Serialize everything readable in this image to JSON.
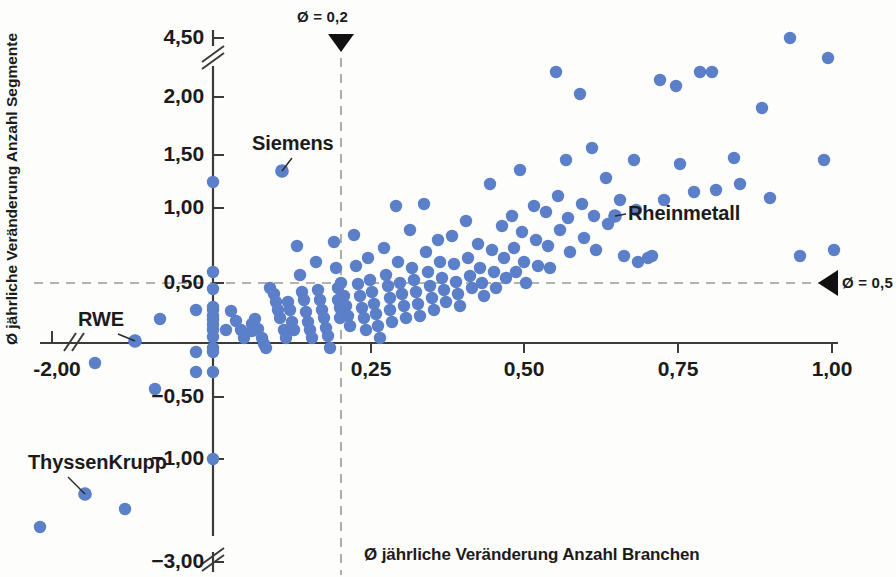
{
  "chart_data": {
    "type": "scatter",
    "title": "",
    "xlabel": "Ø jährliche Veränderung Anzahl Branchen",
    "ylabel": "Ø jährliche Veränderung Anzahl Segmente",
    "xlim": [
      -2.0,
      1.0
    ],
    "ylim": [
      -3.0,
      4.5
    ],
    "grid": false,
    "axis_breaks": {
      "x": "after -2,00",
      "y_top": "between 2,00 and 4,50",
      "y_bottom": "between -1,00 and -3,00"
    },
    "xticks": [
      {
        "label": "-2,00",
        "value": -2.0,
        "px": 57
      },
      {
        "label": "0,25",
        "value": 0.25,
        "px": 371
      },
      {
        "label": "0,50",
        "value": 0.5,
        "px": 524
      },
      {
        "label": "0,75",
        "value": 0.75,
        "px": 678
      },
      {
        "label": "1,00",
        "value": 1.0,
        "px": 832
      }
    ],
    "yticks": [
      {
        "label": "4,50",
        "value": 4.5,
        "px": 38
      },
      {
        "label": "2,00",
        "value": 2.0,
        "px": 97
      },
      {
        "label": "1,50",
        "value": 1.5,
        "px": 155
      },
      {
        "label": "1,00",
        "value": 1.0,
        "px": 208
      },
      {
        "label": "0,50",
        "value": 0.5,
        "px": 283
      },
      {
        "label": "−0,50",
        "value": -0.5,
        "px": 397
      },
      {
        "label": "−1,00",
        "value": -1.0,
        "px": 459
      },
      {
        "label": "−3,00",
        "value": -3.0,
        "px": 562
      }
    ],
    "reference_lines": [
      {
        "name": "mean-x",
        "orientation": "vertical",
        "value": 0.2,
        "label": "Ø = 0,2",
        "px": 341,
        "marker": "down-triangle"
      },
      {
        "name": "mean-y",
        "orientation": "horizontal",
        "value": 0.5,
        "label": "Ø = 0,5",
        "px": 283,
        "marker": "left-triangle"
      }
    ],
    "annotations": [
      {
        "label": "Siemens",
        "x": 0.105,
        "y": 1.43,
        "px": 282,
        "py": 171,
        "label_px": 252,
        "label_py": 132
      },
      {
        "label": "Rheinmetall",
        "x": 0.645,
        "y": 1.03,
        "px": 615,
        "py": 216,
        "label_px": 628,
        "label_py": 202
      },
      {
        "label": "RWE",
        "x": -1.07,
        "y": 0.0,
        "px": 135,
        "py": 341,
        "label_px": 78,
        "label_py": 308
      },
      {
        "label": "ThyssenKrupp",
        "x": -1.62,
        "y": -1.25,
        "px": 85,
        "py": 494,
        "label_px": 28,
        "label_py": 451
      }
    ],
    "points_px": [
      [
        213,
        182
      ],
      [
        213,
        272
      ],
      [
        213,
        289
      ],
      [
        213,
        307
      ],
      [
        213,
        310
      ],
      [
        213,
        316
      ],
      [
        213,
        320
      ],
      [
        213,
        325
      ],
      [
        213,
        330
      ],
      [
        213,
        337
      ],
      [
        213,
        348
      ],
      [
        213,
        352
      ],
      [
        213,
        372
      ],
      [
        213,
        459
      ],
      [
        40,
        527
      ],
      [
        85,
        494
      ],
      [
        95,
        363
      ],
      [
        125,
        509
      ],
      [
        135,
        341
      ],
      [
        155,
        389
      ],
      [
        160,
        319
      ],
      [
        196,
        310
      ],
      [
        196,
        352
      ],
      [
        196,
        372
      ],
      [
        226,
        330
      ],
      [
        231,
        311
      ],
      [
        236,
        321
      ],
      [
        241,
        330
      ],
      [
        244,
        338
      ],
      [
        252,
        324
      ],
      [
        252,
        331
      ],
      [
        255,
        319
      ],
      [
        258,
        329
      ],
      [
        262,
        338
      ],
      [
        264,
        344
      ],
      [
        266,
        348
      ],
      [
        270,
        288
      ],
      [
        274,
        294
      ],
      [
        276,
        302
      ],
      [
        278,
        310
      ],
      [
        280,
        318
      ],
      [
        282,
        171
      ],
      [
        284,
        330
      ],
      [
        286,
        338
      ],
      [
        288,
        302
      ],
      [
        290,
        310
      ],
      [
        292,
        322
      ],
      [
        294,
        330
      ],
      [
        297,
        246
      ],
      [
        300,
        275
      ],
      [
        302,
        292
      ],
      [
        304,
        300
      ],
      [
        306,
        312
      ],
      [
        308,
        322
      ],
      [
        310,
        330
      ],
      [
        312,
        338
      ],
      [
        316,
        262
      ],
      [
        318,
        290
      ],
      [
        320,
        300
      ],
      [
        322,
        310
      ],
      [
        324,
        318
      ],
      [
        326,
        328
      ],
      [
        328,
        336
      ],
      [
        330,
        348
      ],
      [
        334,
        242
      ],
      [
        336,
        268
      ],
      [
        338,
        288
      ],
      [
        338,
        300
      ],
      [
        340,
        308
      ],
      [
        340,
        318
      ],
      [
        341,
        283
      ],
      [
        344,
        296
      ],
      [
        346,
        306
      ],
      [
        348,
        316
      ],
      [
        350,
        326
      ],
      [
        354,
        235
      ],
      [
        356,
        266
      ],
      [
        358,
        284
      ],
      [
        360,
        296
      ],
      [
        362,
        308
      ],
      [
        364,
        318
      ],
      [
        366,
        330
      ],
      [
        368,
        258
      ],
      [
        370,
        280
      ],
      [
        372,
        292
      ],
      [
        374,
        304
      ],
      [
        376,
        314
      ],
      [
        378,
        326
      ],
      [
        380,
        338
      ],
      [
        384,
        248
      ],
      [
        386,
        275
      ],
      [
        388,
        286
      ],
      [
        390,
        298
      ],
      [
        390,
        310
      ],
      [
        392,
        322
      ],
      [
        396,
        206
      ],
      [
        398,
        262
      ],
      [
        400,
        283
      ],
      [
        402,
        294
      ],
      [
        404,
        306
      ],
      [
        406,
        318
      ],
      [
        410,
        230
      ],
      [
        412,
        268
      ],
      [
        414,
        280
      ],
      [
        416,
        292
      ],
      [
        418,
        304
      ],
      [
        420,
        316
      ],
      [
        424,
        204
      ],
      [
        426,
        252
      ],
      [
        428,
        272
      ],
      [
        430,
        286
      ],
      [
        432,
        298
      ],
      [
        434,
        310
      ],
      [
        438,
        240
      ],
      [
        440,
        262
      ],
      [
        442,
        278
      ],
      [
        444,
        290
      ],
      [
        446,
        302
      ],
      [
        452,
        236
      ],
      [
        454,
        264
      ],
      [
        456,
        282
      ],
      [
        458,
        294
      ],
      [
        460,
        306
      ],
      [
        466,
        221
      ],
      [
        468,
        258
      ],
      [
        470,
        276
      ],
      [
        472,
        288
      ],
      [
        478,
        244
      ],
      [
        480,
        268
      ],
      [
        482,
        283
      ],
      [
        484,
        296
      ],
      [
        490,
        184
      ],
      [
        492,
        250
      ],
      [
        494,
        272
      ],
      [
        496,
        288
      ],
      [
        502,
        226
      ],
      [
        504,
        258
      ],
      [
        506,
        278
      ],
      [
        512,
        216
      ],
      [
        514,
        248
      ],
      [
        516,
        272
      ],
      [
        520,
        170
      ],
      [
        522,
        232
      ],
      [
        524,
        262
      ],
      [
        526,
        283
      ],
      [
        534,
        206
      ],
      [
        536,
        240
      ],
      [
        538,
        266
      ],
      [
        546,
        212
      ],
      [
        548,
        246
      ],
      [
        550,
        268
      ],
      [
        556,
        72
      ],
      [
        558,
        196
      ],
      [
        560,
        230
      ],
      [
        566,
        160
      ],
      [
        568,
        218
      ],
      [
        570,
        252
      ],
      [
        580,
        94
      ],
      [
        582,
        204
      ],
      [
        584,
        238
      ],
      [
        592,
        148
      ],
      [
        594,
        216
      ],
      [
        596,
        250
      ],
      [
        606,
        178
      ],
      [
        608,
        224
      ],
      [
        615,
        216
      ],
      [
        620,
        200
      ],
      [
        624,
        256
      ],
      [
        634,
        160
      ],
      [
        636,
        210
      ],
      [
        638,
        262
      ],
      [
        648,
        258
      ],
      [
        652,
        256
      ],
      [
        660,
        80
      ],
      [
        664,
        200
      ],
      [
        676,
        86
      ],
      [
        680,
        164
      ],
      [
        694,
        192
      ],
      [
        700,
        72
      ],
      [
        712,
        72
      ],
      [
        716,
        190
      ],
      [
        734,
        158
      ],
      [
        740,
        184
      ],
      [
        762,
        108
      ],
      [
        770,
        198
      ],
      [
        790,
        38
      ],
      [
        800,
        256
      ],
      [
        824,
        160
      ],
      [
        828,
        58
      ],
      [
        834,
        250
      ]
    ],
    "point_color": "#5b7fc8"
  },
  "labels": {
    "x_axis_title": "Ø jährliche Veränderung Anzahl Branchen",
    "y_axis_title": "Ø jährliche Veränderung Anzahl Segmente"
  }
}
